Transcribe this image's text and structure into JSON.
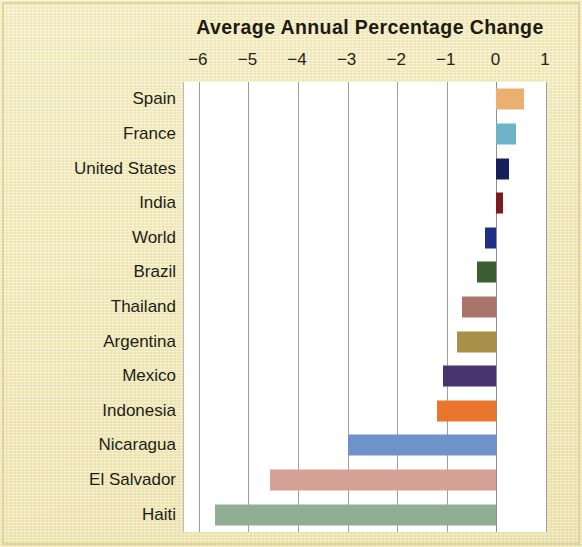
{
  "chart_data": {
    "type": "bar",
    "orientation": "horizontal",
    "title": "Average Annual Percentage Change",
    "xlabel": "",
    "ylabel": "",
    "xlim": [
      -6.3,
      1.02
    ],
    "xticks": [
      -6,
      -5,
      -4,
      -3,
      -2,
      -1,
      0,
      1
    ],
    "xtick_labels": [
      "−6",
      "−5",
      "−4",
      "−3",
      "−2",
      "−1",
      "0",
      "1"
    ],
    "grid": true,
    "legend": "none",
    "categories": [
      "Spain",
      "France",
      "United States",
      "India",
      "World",
      "Brazil",
      "Thailand",
      "Argentina",
      "Mexico",
      "Indonesia",
      "Nicaragua",
      "El Salvador",
      "Haiti"
    ],
    "values": [
      0.56,
      0.4,
      0.25,
      0.13,
      -0.23,
      -0.4,
      -0.7,
      -0.79,
      -1.08,
      -1.2,
      -3.0,
      -4.56,
      -5.67
    ],
    "colors": [
      "#eab070",
      "#6fb3c8",
      "#16205a",
      "#7b1b1f",
      "#1f2f86",
      "#3c5c32",
      "#a9756b",
      "#a89049",
      "#4a3470",
      "#e8762d",
      "#6f92cb",
      "#d4a294",
      "#8fae93"
    ],
    "background_color": "#f3ecbe",
    "plot_background_color": "#ffffff",
    "gridline_color": "#9e9e9e"
  }
}
